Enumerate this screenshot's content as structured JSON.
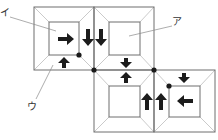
{
  "diagram": {
    "labels": [
      {
        "id": "a",
        "text": "ア",
        "target": "inner square of frame 2"
      },
      {
        "id": "i",
        "text": "イ",
        "target": "inner square of frame 1"
      },
      {
        "id": "u",
        "text": "ウ",
        "target": "bevel of frame 1"
      }
    ],
    "frames": [
      {
        "id": 1,
        "position": "top-left"
      },
      {
        "id": 2,
        "position": "top-right"
      },
      {
        "id": 3,
        "position": "bottom-left"
      },
      {
        "id": 4,
        "position": "bottom-right"
      }
    ],
    "arrows": [
      {
        "dir": "right",
        "location": "frame 1 inner"
      },
      {
        "dir": "up",
        "location": "frame 1 bottom bevel"
      },
      {
        "dir": "down",
        "location": "frame 1 right bevel"
      },
      {
        "dir": "down",
        "location": "frame 2 left bevel"
      },
      {
        "dir": "down",
        "location": "frame 2 bottom bevel"
      },
      {
        "dir": "up",
        "location": "frame 3 top bevel"
      },
      {
        "dir": "up",
        "location": "frame 3 right bevel"
      },
      {
        "dir": "up",
        "location": "frame 4 left bevel"
      },
      {
        "dir": "down",
        "location": "frame 4 top bevel"
      },
      {
        "dir": "left",
        "location": "frame 4 inner"
      }
    ],
    "dots": 4
  }
}
